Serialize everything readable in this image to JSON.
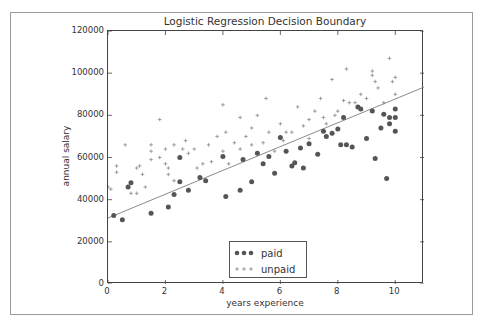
{
  "chart_data": {
    "type": "scatter",
    "title": "Logistic Regression Decision Boundary",
    "xlabel": "years experience",
    "ylabel": "annual salary",
    "xlim": [
      0,
      11
    ],
    "ylim": [
      0,
      120000
    ],
    "xticks": [
      0,
      2,
      4,
      6,
      8,
      10
    ],
    "yticks": [
      0,
      20000,
      40000,
      60000,
      80000,
      100000,
      120000
    ],
    "xtick_labels": [
      "0",
      "2",
      "4",
      "6",
      "8",
      "10"
    ],
    "ytick_labels": [
      "0",
      "20000",
      "40000",
      "60000",
      "80000",
      "100000",
      "120000"
    ],
    "grid": false,
    "legend_position": "lower center",
    "decision_boundary": {
      "x": [
        0,
        11
      ],
      "y": [
        31300,
        93400
      ],
      "color": "#8a8a8a"
    },
    "series": [
      {
        "name": "paid",
        "marker": "circle",
        "color": "#555555",
        "points": [
          [
            0.2,
            32500
          ],
          [
            0.5,
            30500
          ],
          [
            0.7,
            46000
          ],
          [
            0.8,
            48000
          ],
          [
            1.5,
            33500
          ],
          [
            2.1,
            36500
          ],
          [
            2.3,
            42500
          ],
          [
            2.5,
            48500
          ],
          [
            2.5,
            60000
          ],
          [
            2.8,
            44500
          ],
          [
            3.2,
            50500
          ],
          [
            3.4,
            49000
          ],
          [
            4.0,
            60500
          ],
          [
            4.1,
            41500
          ],
          [
            4.6,
            44500
          ],
          [
            4.7,
            59000
          ],
          [
            5.0,
            48500
          ],
          [
            5.2,
            62000
          ],
          [
            5.4,
            57000
          ],
          [
            5.6,
            60500
          ],
          [
            5.8,
            52500
          ],
          [
            6.0,
            69500
          ],
          [
            6.2,
            63000
          ],
          [
            6.4,
            56000
          ],
          [
            6.5,
            57500
          ],
          [
            6.7,
            64500
          ],
          [
            6.8,
            55000
          ],
          [
            7.0,
            66500
          ],
          [
            7.3,
            61500
          ],
          [
            7.5,
            72500
          ],
          [
            7.6,
            70000
          ],
          [
            7.8,
            71500
          ],
          [
            8.0,
            73500
          ],
          [
            8.1,
            66000
          ],
          [
            8.2,
            79000
          ],
          [
            8.3,
            66000
          ],
          [
            8.5,
            65000
          ],
          [
            8.7,
            84000
          ],
          [
            8.8,
            83000
          ],
          [
            9.0,
            69000
          ],
          [
            9.2,
            82000
          ],
          [
            9.3,
            59500
          ],
          [
            9.5,
            74000
          ],
          [
            9.6,
            80500
          ],
          [
            9.7,
            50000
          ],
          [
            9.8,
            79000
          ],
          [
            9.8,
            76000
          ],
          [
            10.0,
            83000
          ],
          [
            10.0,
            72500
          ],
          [
            10.0,
            79000
          ]
        ]
      },
      {
        "name": "unpaid",
        "marker": "plus",
        "color": "#8a8a8a",
        "points": [
          [
            0.0,
            46000
          ],
          [
            0.1,
            45000
          ],
          [
            0.3,
            56000
          ],
          [
            0.3,
            53000
          ],
          [
            0.6,
            66000
          ],
          [
            0.8,
            43000
          ],
          [
            1.0,
            55000
          ],
          [
            1.0,
            43000
          ],
          [
            1.1,
            56000
          ],
          [
            1.2,
            52000
          ],
          [
            1.3,
            46000
          ],
          [
            1.5,
            66000
          ],
          [
            1.5,
            63000
          ],
          [
            1.5,
            59000
          ],
          [
            1.8,
            60000
          ],
          [
            1.8,
            78000
          ],
          [
            2.0,
            64000
          ],
          [
            2.0,
            57000
          ],
          [
            2.1,
            55000
          ],
          [
            2.1,
            52000
          ],
          [
            2.3,
            66000
          ],
          [
            2.3,
            49000
          ],
          [
            2.5,
            60000
          ],
          [
            2.6,
            64000
          ],
          [
            2.7,
            68000
          ],
          [
            2.8,
            62000
          ],
          [
            3.0,
            64000
          ],
          [
            3.1,
            55000
          ],
          [
            3.3,
            57000
          ],
          [
            3.5,
            66000
          ],
          [
            3.6,
            58000
          ],
          [
            3.8,
            70000
          ],
          [
            4.0,
            63000
          ],
          [
            4.0,
            85000
          ],
          [
            4.1,
            72000
          ],
          [
            4.2,
            57000
          ],
          [
            4.4,
            67000
          ],
          [
            4.6,
            64000
          ],
          [
            4.6,
            79000
          ],
          [
            4.8,
            70000
          ],
          [
            5.0,
            74000
          ],
          [
            5.0,
            66000
          ],
          [
            5.2,
            80000
          ],
          [
            5.4,
            67000
          ],
          [
            5.5,
            88000
          ],
          [
            5.6,
            72000
          ],
          [
            5.8,
            63000
          ],
          [
            6.0,
            76000
          ],
          [
            6.1,
            68000
          ],
          [
            6.2,
            72000
          ],
          [
            6.4,
            72000
          ],
          [
            6.6,
            84000
          ],
          [
            6.8,
            75000
          ],
          [
            7.0,
            78000
          ],
          [
            7.0,
            69000
          ],
          [
            7.2,
            82000
          ],
          [
            7.4,
            88000
          ],
          [
            7.5,
            79000
          ],
          [
            7.6,
            76000
          ],
          [
            7.8,
            97000
          ],
          [
            7.9,
            80000
          ],
          [
            8.0,
            82000
          ],
          [
            8.2,
            87000
          ],
          [
            8.3,
            102000
          ],
          [
            8.4,
            86000
          ],
          [
            8.6,
            86000
          ],
          [
            8.8,
            90000
          ],
          [
            9.0,
            88000
          ],
          [
            9.2,
            99000
          ],
          [
            9.2,
            101000
          ],
          [
            9.3,
            96000
          ],
          [
            9.4,
            93000
          ],
          [
            9.6,
            86000
          ],
          [
            9.8,
            107000
          ],
          [
            9.9,
            96000
          ],
          [
            10.0,
            90000
          ],
          [
            10.0,
            98000
          ]
        ]
      }
    ]
  },
  "legend": {
    "items": [
      {
        "label": "paid"
      },
      {
        "label": "unpaid"
      }
    ]
  }
}
